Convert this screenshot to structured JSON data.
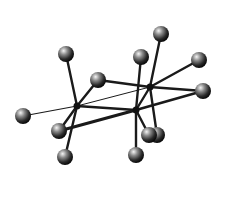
{
  "diagram": {
    "title": "Ball-and-stick molecular model",
    "colors": {
      "background": "#ffffff",
      "bond": "#1a1a1a",
      "atom_dark": "#111111",
      "atom_light": "#f2f2f2"
    },
    "centers": [
      {
        "id": "L",
        "x": 77,
        "y": 106
      },
      {
        "id": "R1",
        "x": 150,
        "y": 87
      },
      {
        "id": "R2",
        "x": 136,
        "y": 110
      }
    ],
    "atoms": [
      {
        "id": "G",
        "x": 161,
        "y": 34,
        "r": 8
      },
      {
        "id": "A",
        "x": 66,
        "y": 54,
        "r": 8
      },
      {
        "id": "F",
        "x": 141,
        "y": 57,
        "r": 8
      },
      {
        "id": "H",
        "x": 199,
        "y": 60,
        "r": 8
      },
      {
        "id": "B",
        "x": 98,
        "y": 80,
        "r": 8
      },
      {
        "id": "I",
        "x": 203,
        "y": 91,
        "r": 8
      },
      {
        "id": "C",
        "x": 23,
        "y": 116,
        "r": 8
      },
      {
        "id": "J2",
        "x": 157,
        "y": 135,
        "r": 8
      },
      {
        "id": "J1",
        "x": 149,
        "y": 135,
        "r": 8
      },
      {
        "id": "D",
        "x": 59,
        "y": 131,
        "r": 8
      },
      {
        "id": "K",
        "x": 136,
        "y": 155,
        "r": 8
      },
      {
        "id": "E",
        "x": 65,
        "y": 157,
        "r": 8
      }
    ],
    "bonds": [
      {
        "from": "C",
        "to": "L",
        "w": 1.2
      },
      {
        "from": "L",
        "to": "R1",
        "w": 1.0
      },
      {
        "from": "A",
        "to": "L",
        "w": 2.4
      },
      {
        "from": "B",
        "to": "L",
        "w": 2.4
      },
      {
        "from": "D",
        "to": "L",
        "w": 2.4
      },
      {
        "from": "E",
        "to": "L",
        "w": 2.4
      },
      {
        "from": "L",
        "to": "R2",
        "w": 2.4
      },
      {
        "from": "D",
        "to": "R2",
        "w": 3.0
      },
      {
        "from": "B",
        "to": "R1",
        "w": 2.4
      },
      {
        "from": "G",
        "to": "R1",
        "w": 2.4
      },
      {
        "from": "H",
        "to": "R1",
        "w": 2.4
      },
      {
        "from": "I",
        "to": "R1",
        "w": 2.4
      },
      {
        "from": "R1",
        "to": "R2",
        "w": 2.4
      },
      {
        "from": "R1",
        "to": "J2",
        "w": 2.4
      },
      {
        "from": "F",
        "to": "R2",
        "w": 2.4
      },
      {
        "from": "I",
        "to": "R2",
        "w": 2.6
      },
      {
        "from": "R2",
        "to": "K",
        "w": 2.4
      },
      {
        "from": "R2",
        "to": "J1",
        "w": 2.4
      }
    ]
  }
}
